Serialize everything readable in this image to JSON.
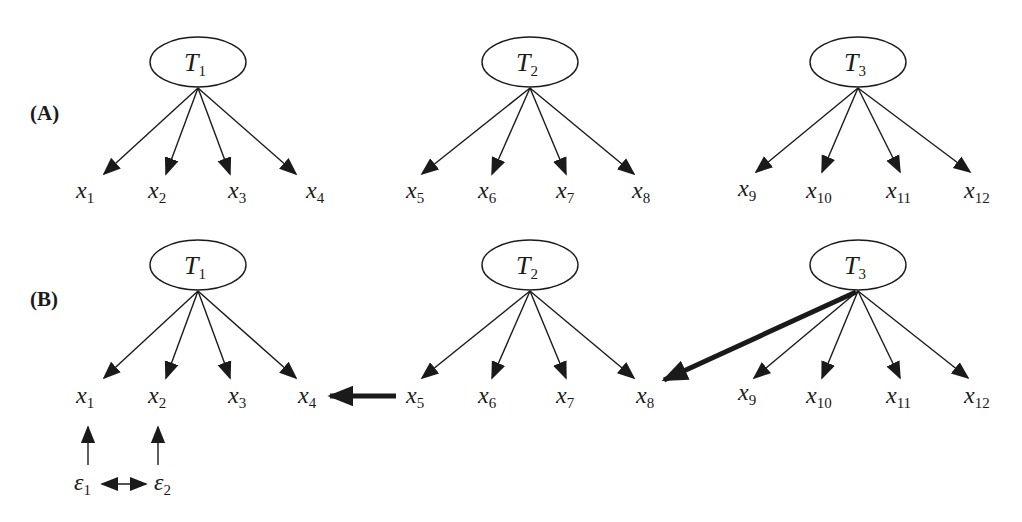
{
  "panels": [
    {
      "label": "(A)",
      "factors": [
        {
          "name": "T",
          "sub": "1",
          "indicators": [
            {
              "name": "x",
              "sub": "1"
            },
            {
              "name": "x",
              "sub": "2"
            },
            {
              "name": "x",
              "sub": "3"
            },
            {
              "name": "x",
              "sub": "4"
            }
          ]
        },
        {
          "name": "T",
          "sub": "2",
          "indicators": [
            {
              "name": "x",
              "sub": "5"
            },
            {
              "name": "x",
              "sub": "6"
            },
            {
              "name": "x",
              "sub": "7"
            },
            {
              "name": "x",
              "sub": "8"
            }
          ]
        },
        {
          "name": "T",
          "sub": "3",
          "indicators": [
            {
              "name": "x",
              "sub": "9"
            },
            {
              "name": "x",
              "sub": "10"
            },
            {
              "name": "x",
              "sub": "11"
            },
            {
              "name": "x",
              "sub": "12"
            }
          ]
        }
      ]
    },
    {
      "label": "(B)",
      "factors": [
        {
          "name": "T",
          "sub": "1",
          "indicators": [
            {
              "name": "x",
              "sub": "1"
            },
            {
              "name": "x",
              "sub": "2"
            },
            {
              "name": "x",
              "sub": "3"
            },
            {
              "name": "x",
              "sub": "4"
            }
          ]
        },
        {
          "name": "T",
          "sub": "2",
          "indicators": [
            {
              "name": "x",
              "sub": "5"
            },
            {
              "name": "x",
              "sub": "6"
            },
            {
              "name": "x",
              "sub": "7"
            },
            {
              "name": "x",
              "sub": "8"
            }
          ]
        },
        {
          "name": "T",
          "sub": "3",
          "indicators": [
            {
              "name": "x",
              "sub": "9"
            },
            {
              "name": "x",
              "sub": "10"
            },
            {
              "name": "x",
              "sub": "11"
            },
            {
              "name": "x",
              "sub": "12"
            }
          ]
        }
      ],
      "errors": [
        {
          "name": "ε",
          "sub": "1"
        },
        {
          "name": "ε",
          "sub": "2"
        }
      ],
      "extra_paths": [
        {
          "from": "x5",
          "to": "x4",
          "style": "bold"
        },
        {
          "from": "T3",
          "to": "x8",
          "style": "bold"
        },
        {
          "from": "ε1",
          "to": "ε2",
          "style": "bidirectional"
        }
      ]
    }
  ]
}
